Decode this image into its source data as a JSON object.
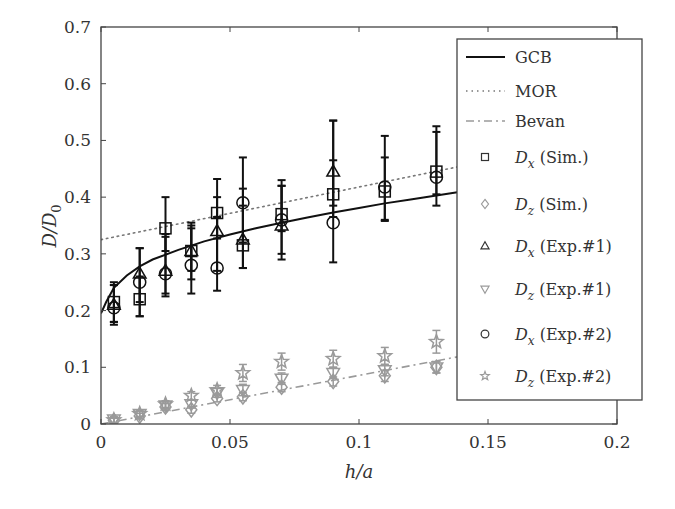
{
  "chart_data": {
    "type": "scatter",
    "title": "",
    "xlabel": "h/a",
    "ylabel": "D/D0",
    "xlim": [
      0,
      0.2
    ],
    "ylim": [
      0,
      0.7
    ],
    "xticks": [
      0,
      0.05,
      0.1,
      0.15,
      0.2
    ],
    "xtick_labels": [
      "0",
      "0.05",
      "0.1",
      "0.15",
      "0.2"
    ],
    "yticks": [
      0,
      0.1,
      0.2,
      0.3,
      0.4,
      0.5,
      0.6,
      0.7
    ],
    "ytick_labels": [
      "0",
      "0.1",
      "0.2",
      "0.3",
      "0.4",
      "0.5",
      "0.6",
      "0.7"
    ],
    "grid": false,
    "legend_position": "upper right (outside right edge)",
    "colors": {
      "black": "#111111",
      "gray": "#9a9a9a",
      "axis": "#444444"
    },
    "lines": [
      {
        "name": "GCB",
        "style": "solid",
        "color": "#111111",
        "x": [
          0,
          0.002,
          0.005,
          0.01,
          0.015,
          0.02,
          0.03,
          0.04,
          0.05,
          0.06,
          0.07,
          0.08,
          0.09,
          0.1,
          0.11,
          0.12,
          0.13,
          0.14
        ],
        "y": [
          0.195,
          0.215,
          0.24,
          0.262,
          0.278,
          0.29,
          0.307,
          0.322,
          0.334,
          0.345,
          0.355,
          0.364,
          0.373,
          0.381,
          0.389,
          0.396,
          0.403,
          0.41
        ]
      },
      {
        "name": "MOR",
        "style": "dotted",
        "color": "#777777",
        "x": [
          0,
          0.14
        ],
        "y": [
          0.325,
          0.455
        ]
      },
      {
        "name": "Bevan",
        "style": "dashdot",
        "color": "#9a9a9a",
        "x": [
          0,
          0.14
        ],
        "y": [
          0.0,
          0.12
        ]
      }
    ],
    "x": [
      0.005,
      0.015,
      0.025,
      0.035,
      0.045,
      0.055,
      0.07,
      0.09,
      0.11,
      0.13
    ],
    "series": [
      {
        "name": "Dx (Sim.)",
        "marker": "square",
        "color": "#111111",
        "values": [
          0.215,
          0.22,
          0.345,
          0.305,
          0.372,
          0.315,
          0.37,
          0.405,
          0.41,
          0.445
        ],
        "err_low": [
          0.035,
          0.03,
          0.04,
          0.035,
          0.045,
          0.04,
          0.03,
          0.04,
          0.05,
          0.04
        ],
        "err_high": [
          0.03,
          0.04,
          0.055,
          0.05,
          0.06,
          0.07,
          0.05,
          0.06,
          0.06,
          0.07
        ]
      },
      {
        "name": "Dz (Sim.)",
        "marker": "diamond",
        "color": "#9a9a9a",
        "values": [
          0.006,
          0.014,
          0.03,
          0.025,
          0.045,
          0.048,
          0.065,
          0.075,
          0.085,
          0.1
        ],
        "err_low": [
          0.004,
          0.005,
          0.006,
          0.006,
          0.006,
          0.007,
          0.008,
          0.008,
          0.01,
          0.01
        ],
        "err_high": [
          0.004,
          0.005,
          0.006,
          0.006,
          0.006,
          0.007,
          0.008,
          0.008,
          0.01,
          0.01
        ]
      },
      {
        "name": "Dx (Exp.#1)",
        "marker": "triangle-up",
        "color": "#111111",
        "values": [
          0.21,
          0.265,
          0.27,
          0.305,
          0.34,
          0.325,
          0.35,
          0.445,
          null,
          null
        ],
        "err_low": [
          0.03,
          0.05,
          0.04,
          0.05,
          0.07,
          0.05,
          0.06,
          0.06,
          null,
          null
        ],
        "err_high": [
          0.04,
          0.045,
          0.06,
          0.04,
          0.06,
          0.09,
          0.07,
          0.09,
          null,
          null
        ]
      },
      {
        "name": "Dz (Exp.#1)",
        "marker": "triangle-down",
        "color": "#9a9a9a",
        "values": [
          0.008,
          0.018,
          0.033,
          0.035,
          0.055,
          0.06,
          0.08,
          0.09,
          0.095,
          0.1
        ],
        "err_low": [
          0.005,
          0.005,
          0.006,
          0.007,
          0.008,
          0.01,
          0.01,
          0.01,
          0.01,
          0.01
        ],
        "err_high": [
          0.005,
          0.005,
          0.006,
          0.007,
          0.008,
          0.01,
          0.01,
          0.01,
          0.01,
          0.01
        ]
      },
      {
        "name": "Dx (Exp.#2)",
        "marker": "circle",
        "color": "#111111",
        "values": [
          0.205,
          0.25,
          0.265,
          0.28,
          0.275,
          0.39,
          0.36,
          0.355,
          0.418,
          0.435
        ],
        "err_low": [
          0.03,
          0.06,
          0.04,
          0.05,
          0.04,
          0.07,
          0.06,
          0.07,
          0.06,
          0.05
        ],
        "err_high": [
          0.04,
          0.06,
          0.07,
          0.07,
          0.09,
          0.08,
          0.07,
          0.18,
          0.09,
          0.09
        ]
      },
      {
        "name": "Dz (Exp.#2)",
        "marker": "star",
        "color": "#9a9a9a",
        "values": [
          0.007,
          0.018,
          0.035,
          0.05,
          0.06,
          0.09,
          0.11,
          0.115,
          0.12,
          0.145
        ],
        "err_low": [
          0.005,
          0.005,
          0.006,
          0.007,
          0.008,
          0.015,
          0.015,
          0.015,
          0.015,
          0.02
        ],
        "err_high": [
          0.005,
          0.005,
          0.006,
          0.007,
          0.008,
          0.015,
          0.015,
          0.015,
          0.015,
          0.02
        ]
      }
    ],
    "legend": [
      {
        "label_main": "GCB",
        "sym": "line-solid"
      },
      {
        "label_main": "MOR",
        "sym": "line-dotted"
      },
      {
        "label_main": "Bevan",
        "sym": "line-dashdot"
      },
      {
        "label_var": "D",
        "label_sub": "x",
        "label_rest": " (Sim.)",
        "sym": "square"
      },
      {
        "label_var": "D",
        "label_sub": "z",
        "label_rest": " (Sim.)",
        "sym": "diamond"
      },
      {
        "label_var": "D",
        "label_sub": "x",
        "label_rest": " (Exp.#1)",
        "sym": "triangle-up"
      },
      {
        "label_var": "D",
        "label_sub": "z",
        "label_rest": " (Exp.#1)",
        "sym": "triangle-down"
      },
      {
        "label_var": "D",
        "label_sub": "x",
        "label_rest": " (Exp.#2)",
        "sym": "circle"
      },
      {
        "label_var": "D",
        "label_sub": "z",
        "label_rest": " (Exp.#2)",
        "sym": "star"
      }
    ]
  }
}
